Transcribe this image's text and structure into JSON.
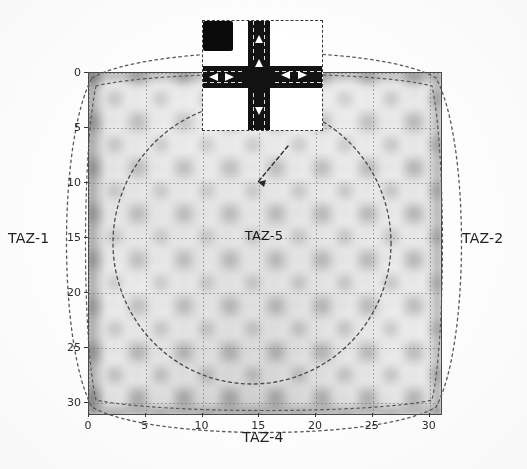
{
  "figure": {
    "width": 527,
    "height": 469,
    "background_color": "#ffffff",
    "plot_border_color": "#4a4a4a"
  },
  "zone_labels": {
    "top": "TAZ-3",
    "bottom": "TAZ-4",
    "left": "TAZ-1",
    "right": "TAZ-2",
    "center": "TAZ-5"
  },
  "axes": {
    "x": {
      "ticks": [
        "0",
        "5",
        "10",
        "15",
        "20",
        "25",
        "30"
      ],
      "values": [
        0,
        5,
        10,
        15,
        20,
        25,
        30
      ],
      "min": 0,
      "max": 31
    },
    "y": {
      "ticks": [
        "0",
        "5",
        "10",
        "15",
        "20",
        "25",
        "30"
      ],
      "values": [
        0,
        5,
        10,
        15,
        20,
        25,
        30
      ],
      "min": 0,
      "max": 31,
      "inverted": true
    }
  },
  "inset": {
    "name": "intersection-detail",
    "description": "four-leg signalized intersection detail",
    "border_style": "dashed",
    "road_color": "#121212",
    "marking_color": "#ffffff"
  },
  "chart_data": {
    "type": "heatmap",
    "title": "",
    "xlabel": "TAZ-4",
    "ylabel": "TAZ-1",
    "xlim": [
      0,
      31
    ],
    "ylim": [
      31,
      0
    ],
    "grid": true,
    "legend": "none",
    "colormap": "grayscale",
    "x_ticks": [
      0,
      5,
      10,
      15,
      20,
      25,
      30
    ],
    "y_ticks": [
      0,
      5,
      10,
      15,
      20,
      25,
      30
    ],
    "annotations": [
      {
        "text": "TAZ-3",
        "position": "top-outside"
      },
      {
        "text": "TAZ-4",
        "position": "bottom-outside"
      },
      {
        "text": "TAZ-1",
        "position": "left-outside"
      },
      {
        "text": "TAZ-2",
        "position": "right-outside"
      },
      {
        "text": "TAZ-5",
        "position": "center-inside",
        "x": 15,
        "y": 15
      }
    ],
    "zone_boundaries": [
      {
        "name": "TAZ-3",
        "shape": "arc-top",
        "style": "dotted"
      },
      {
        "name": "TAZ-4",
        "shape": "arc-bottom",
        "style": "dotted"
      },
      {
        "name": "TAZ-1",
        "shape": "arc-left",
        "style": "dotted"
      },
      {
        "name": "TAZ-2",
        "shape": "arc-right",
        "style": "dotted"
      },
      {
        "name": "TAZ-5",
        "shape": "ellipse-center",
        "style": "dotted"
      }
    ]
  }
}
